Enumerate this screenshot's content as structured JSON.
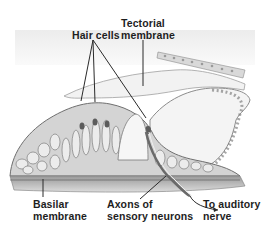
{
  "diagram": {
    "colors": {
      "label": "#1e1e1e",
      "leader": "#2a2a2a",
      "tissue_dark": "#7a7a7a",
      "tissue_mid": "#a8a8a8",
      "tissue_light": "#d6d6d6",
      "background": "#ffffff"
    },
    "labels": {
      "tectorial": {
        "line1": "Tectorial",
        "line2": "membrane"
      },
      "hair_cells": {
        "text": "Hair cells"
      },
      "basilar": {
        "line1": "Basilar",
        "line2": "membrane"
      },
      "axons": {
        "line1": "Axons of",
        "line2": "sensory neurons"
      },
      "auditory": {
        "line1": "To auditory",
        "line2": "nerve"
      }
    }
  }
}
